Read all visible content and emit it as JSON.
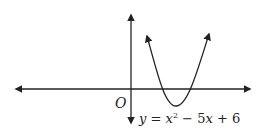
{
  "diagram": {
    "title": "",
    "origin_label": "O",
    "equation": {
      "lhs": "y",
      "eq": " = ",
      "x": "x",
      "exp": "2",
      "rest": " − 5",
      "x2": "x",
      "tail": " + 6",
      "full": "y = x² − 5x + 6"
    },
    "axes": {
      "x_axis": "double-arrowed horizontal axis",
      "y_axis": "double-arrowed vertical axis"
    },
    "curve": {
      "type": "parabola opening upward",
      "roots": [
        2,
        3
      ],
      "vertex": [
        2.5,
        -0.25
      ]
    },
    "colors": {
      "stroke": "#222222",
      "background": "#ffffff"
    }
  }
}
